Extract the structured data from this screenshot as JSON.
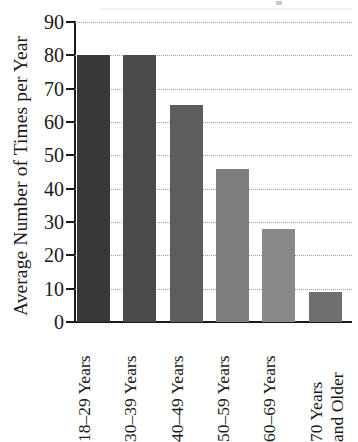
{
  "chart_data": {
    "type": "bar",
    "title": "",
    "xlabel": "",
    "ylabel": "Average Number of Times per Year",
    "categories": [
      "18–29 Years",
      "30–39 Years",
      "40–49 Years",
      "50–59 Years",
      "60–69 Years",
      "70 Years and Older"
    ],
    "category_lines": [
      [
        "18–29 Years"
      ],
      [
        "30–39 Years"
      ],
      [
        "40–49 Years"
      ],
      [
        "50–59 Years"
      ],
      [
        "60–69 Years"
      ],
      [
        "70 Years",
        "and Older"
      ]
    ],
    "values": [
      80,
      80,
      65,
      46,
      28,
      9
    ],
    "ylim": [
      0,
      90
    ],
    "ytick_values": [
      0,
      10,
      20,
      30,
      40,
      50,
      60,
      70,
      80,
      90
    ],
    "ytick_labels": [
      "0",
      "10",
      "20",
      "30",
      "40",
      "50",
      "60",
      "70",
      "80",
      "90"
    ],
    "grid": true,
    "grid_style": "dotted",
    "legend": "none",
    "bar_colors": [
      "#383838",
      "#4a4a4a",
      "#5d5d5d",
      "#7d7d7d",
      "#888888",
      "#6f6f6f"
    ],
    "axis_color": "#1a1a1a",
    "grid_color": "#9e9e9e",
    "background_color": "#ffffff"
  }
}
